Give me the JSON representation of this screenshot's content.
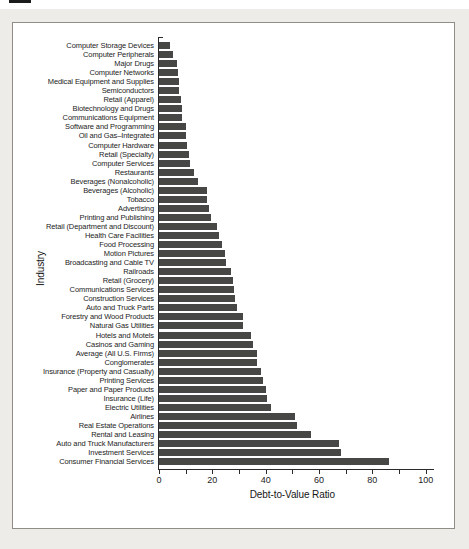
{
  "chart_data": {
    "type": "bar",
    "orientation": "horizontal",
    "title": "",
    "xlabel": "Debt-to-Value Ratio",
    "ylabel": "Industry",
    "xlim": [
      0,
      100
    ],
    "x_ticks": [
      0,
      20,
      40,
      60,
      80,
      100
    ],
    "x_tick_labels": [
      "0",
      "20",
      "40",
      "60",
      "80",
      "100"
    ],
    "x_minor_tick_step": 10,
    "grid": false,
    "legend": false,
    "bar_color": "#474745",
    "categories": [
      "Computer Storage Devices",
      "Computer Peripherals",
      "Major Drugs",
      "Computer Networks",
      "Medical Equipment and Supplies",
      "Semiconductors",
      "Retail (Apparel)",
      "Biotechnology and Drugs",
      "Communications Equipment",
      "Software and Programming",
      "Oil and Gas–Integrated",
      "Computer Hardware",
      "Retail (Specialty)",
      "Computer Services",
      "Restaurants",
      "Beverages (Nonalcoholic)",
      "Beverages (Alcoholic)",
      "Tobacco",
      "Advertising",
      "Printing and Publishing",
      "Retail (Department and Discount)",
      "Health Care Facilities",
      "Food Processing",
      "Motion Pictures",
      "Broadcasting and Cable TV",
      "Railroads",
      "Retail (Grocery)",
      "Communications Services",
      "Construction Services",
      "Auto and Truck Parts",
      "Forestry and Wood Products",
      "Natural Gas Utilities",
      "Hotels and Motels",
      "Casinos and Gaming",
      "Average (All U.S. Firms)",
      "Conglomerates",
      "Insurance (Property and Casualty)",
      "Printing Services",
      "Paper and Paper Products",
      "Insurance (Life)",
      "Electric Utilities",
      "Airlines",
      "Real Estate Operations",
      "Rental and Leasing",
      "Auto and Truck Manufacturers",
      "Investment Services",
      "Consumer Financial Services"
    ],
    "values": [
      4.5,
      5.5,
      7,
      7.5,
      8,
      8,
      8.5,
      9,
      9,
      10.5,
      10.5,
      11,
      11.5,
      12,
      13.5,
      15,
      18.5,
      18.5,
      19,
      20,
      22,
      23,
      24,
      25,
      25.5,
      27.5,
      28,
      28.5,
      29,
      29.5,
      32,
      32,
      35,
      35.5,
      37,
      37,
      38.5,
      39.5,
      40.5,
      41,
      42.5,
      51.5,
      52,
      57.5,
      68,
      68.5,
      86.5
    ]
  }
}
